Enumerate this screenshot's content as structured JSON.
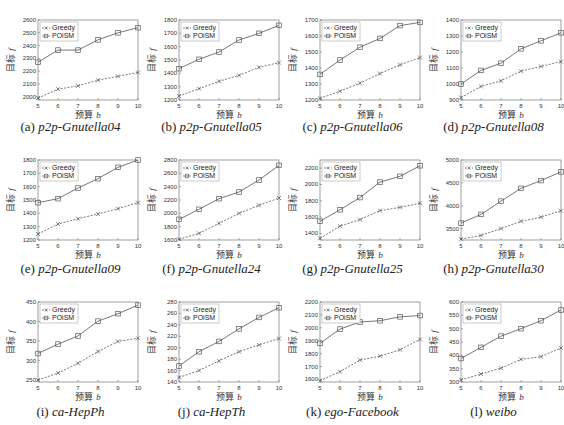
{
  "figure": {
    "x_label_text": "预算",
    "x_label_var": "b",
    "y_label_text": "目标",
    "y_label_var": "f",
    "legend": [
      "Greedy",
      "POiSM"
    ],
    "colors": {
      "line": "#555555",
      "axis": "#777777",
      "text": "#333333"
    }
  },
  "chart_data": [
    {
      "type": "line",
      "panel": "(a)",
      "title": "p2p-Gnutella04",
      "xlabel": "预算 b",
      "ylabel": "目标 f",
      "x": [
        5,
        6,
        7,
        8,
        9,
        10
      ],
      "yticks": [
        2000,
        2100,
        2200,
        2300,
        2400,
        2500,
        2600
      ],
      "ylim": [
        1975,
        2600
      ],
      "series": [
        {
          "name": "Greedy",
          "marker": "x",
          "linestyle": "dashed",
          "values": [
            1990,
            2060,
            2085,
            2130,
            2160,
            2190
          ]
        },
        {
          "name": "POiSM",
          "marker": "square",
          "linestyle": "solid",
          "values": [
            2270,
            2365,
            2365,
            2445,
            2500,
            2540
          ]
        }
      ],
      "legend_position": "upper left",
      "grid": false
    },
    {
      "type": "line",
      "panel": "(b)",
      "title": "p2p-Gnutella05",
      "xlabel": "预算 b",
      "ylabel": "目标 f",
      "x": [
        5,
        6,
        7,
        8,
        9,
        10
      ],
      "yticks": [
        1200,
        1300,
        1400,
        1500,
        1600,
        1700,
        1800
      ],
      "ylim": [
        1200,
        1800
      ],
      "series": [
        {
          "name": "Greedy",
          "marker": "x",
          "linestyle": "dashed",
          "values": [
            1230,
            1285,
            1340,
            1385,
            1445,
            1480
          ]
        },
        {
          "name": "POiSM",
          "marker": "square",
          "linestyle": "solid",
          "values": [
            1435,
            1505,
            1560,
            1650,
            1700,
            1760
          ]
        }
      ],
      "legend_position": "upper left",
      "grid": false
    },
    {
      "type": "line",
      "panel": "(c)",
      "title": "p2p-Gnutella06",
      "xlabel": "预算 b",
      "ylabel": "目标 f",
      "x": [
        5,
        6,
        7,
        8,
        9,
        10
      ],
      "yticks": [
        1200,
        1300,
        1400,
        1500,
        1600,
        1700
      ],
      "ylim": [
        1200,
        1700
      ],
      "series": [
        {
          "name": "Greedy",
          "marker": "x",
          "linestyle": "dashed",
          "values": [
            1210,
            1255,
            1305,
            1365,
            1420,
            1465
          ]
        },
        {
          "name": "POiSM",
          "marker": "square",
          "linestyle": "solid",
          "values": [
            1360,
            1450,
            1530,
            1585,
            1665,
            1685
          ]
        }
      ],
      "legend_position": "upper left",
      "grid": false
    },
    {
      "type": "line",
      "panel": "(d)",
      "title": "p2p-Gnutella08",
      "xlabel": "预算 b",
      "ylabel": "目标 f",
      "x": [
        5,
        6,
        7,
        8,
        9,
        10
      ],
      "yticks": [
        900,
        1000,
        1100,
        1200,
        1300,
        1400
      ],
      "ylim": [
        900,
        1400
      ],
      "series": [
        {
          "name": "Greedy",
          "marker": "x",
          "linestyle": "dashed",
          "values": [
            915,
            985,
            1020,
            1080,
            1110,
            1140
          ]
        },
        {
          "name": "POiSM",
          "marker": "square",
          "linestyle": "solid",
          "values": [
            1000,
            1085,
            1130,
            1220,
            1270,
            1320
          ]
        }
      ],
      "legend_position": "upper left",
      "grid": false
    },
    {
      "type": "line",
      "panel": "(e)",
      "title": "p2p-Gnutella09",
      "xlabel": "预算 b",
      "ylabel": "目标 f",
      "x": [
        5,
        6,
        7,
        8,
        9,
        10
      ],
      "yticks": [
        1200,
        1300,
        1400,
        1500,
        1600,
        1700,
        1800
      ],
      "ylim": [
        1200,
        1800
      ],
      "series": [
        {
          "name": "Greedy",
          "marker": "x",
          "linestyle": "dashed",
          "values": [
            1245,
            1320,
            1360,
            1395,
            1435,
            1480
          ]
        },
        {
          "name": "POiSM",
          "marker": "square",
          "linestyle": "solid",
          "values": [
            1480,
            1510,
            1590,
            1660,
            1745,
            1800
          ]
        }
      ],
      "legend_position": "upper left",
      "grid": false
    },
    {
      "type": "line",
      "panel": "(f)",
      "title": "p2p-Gnutella24",
      "xlabel": "预算 b",
      "ylabel": "目标 f",
      "x": [
        5,
        6,
        7,
        8,
        9,
        10
      ],
      "yticks": [
        1600,
        1800,
        2000,
        2200,
        2400,
        2600,
        2800
      ],
      "ylim": [
        1600,
        2800
      ],
      "series": [
        {
          "name": "Greedy",
          "marker": "x",
          "linestyle": "dashed",
          "values": [
            1610,
            1700,
            1850,
            2000,
            2120,
            2230
          ]
        },
        {
          "name": "POiSM",
          "marker": "square",
          "linestyle": "solid",
          "values": [
            1910,
            2060,
            2220,
            2320,
            2500,
            2720
          ]
        }
      ],
      "legend_position": "upper left",
      "grid": false
    },
    {
      "type": "line",
      "panel": "(g)",
      "title": "p2p-Gnutella25",
      "xlabel": "预算 b",
      "ylabel": "目标 f",
      "x": [
        5,
        6,
        7,
        8,
        9,
        10
      ],
      "yticks": [
        1400,
        1600,
        1800,
        2000,
        2200
      ],
      "ylim": [
        1320,
        2300
      ],
      "series": [
        {
          "name": "Greedy",
          "marker": "x",
          "linestyle": "dashed",
          "values": [
            1340,
            1490,
            1570,
            1680,
            1720,
            1770
          ]
        },
        {
          "name": "POiSM",
          "marker": "square",
          "linestyle": "solid",
          "values": [
            1550,
            1690,
            1840,
            2030,
            2100,
            2230
          ]
        }
      ],
      "legend_position": "upper left",
      "grid": false
    },
    {
      "type": "line",
      "panel": "(h)",
      "title": "p2p-Gnutella30",
      "xlabel": "预算 b",
      "ylabel": "目标 f",
      "x": [
        5,
        6,
        7,
        8,
        9,
        10
      ],
      "yticks": [
        3500,
        4000,
        4500,
        5000
      ],
      "ylim": [
        3250,
        5000
      ],
      "series": [
        {
          "name": "Greedy",
          "marker": "x",
          "linestyle": "dashed",
          "values": [
            3270,
            3350,
            3500,
            3660,
            3750,
            3890
          ]
        },
        {
          "name": "POiSM",
          "marker": "square",
          "linestyle": "solid",
          "values": [
            3620,
            3810,
            4100,
            4380,
            4550,
            4740
          ]
        }
      ],
      "legend_position": "upper left",
      "grid": false
    },
    {
      "type": "line",
      "panel": "(i)",
      "title": "ca-HepPh",
      "xlabel": "预算 b",
      "ylabel": "目标 f",
      "x": [
        5,
        6,
        7,
        8,
        9,
        10
      ],
      "yticks": [
        250,
        300,
        350,
        400,
        450
      ],
      "ylim": [
        245,
        450
      ],
      "series": [
        {
          "name": "Greedy",
          "marker": "x",
          "linestyle": "dashed",
          "values": [
            250,
            268,
            293,
            323,
            349,
            357
          ]
        },
        {
          "name": "POiSM",
          "marker": "square",
          "linestyle": "solid",
          "values": [
            318,
            342,
            363,
            401,
            420,
            442
          ]
        }
      ],
      "legend_position": "upper left",
      "grid": false
    },
    {
      "type": "line",
      "panel": "(j)",
      "title": "ca-HepTh",
      "xlabel": "预算 b",
      "ylabel": "目标 f",
      "x": [
        5,
        6,
        7,
        8,
        9,
        10
      ],
      "yticks": [
        140,
        160,
        180,
        200,
        220,
        240,
        260,
        280
      ],
      "ylim": [
        140,
        280
      ],
      "series": [
        {
          "name": "Greedy",
          "marker": "x",
          "linestyle": "dashed",
          "values": [
            148,
            160,
            177,
            193,
            205,
            216
          ]
        },
        {
          "name": "POiSM",
          "marker": "square",
          "linestyle": "solid",
          "values": [
            168,
            193,
            211,
            233,
            253,
            270
          ]
        }
      ],
      "legend_position": "upper left",
      "grid": false
    },
    {
      "type": "line",
      "panel": "(k)",
      "title": "ego-Facebook",
      "xlabel": "预算 b",
      "ylabel": "目标 f",
      "x": [
        5,
        6,
        7,
        8,
        9,
        10
      ],
      "yticks": [
        1600,
        1700,
        1800,
        1900,
        2000,
        2100,
        2200
      ],
      "ylim": [
        1580,
        2200
      ],
      "series": [
        {
          "name": "Greedy",
          "marker": "x",
          "linestyle": "dashed",
          "values": [
            1590,
            1660,
            1750,
            1780,
            1830,
            1910
          ]
        },
        {
          "name": "POiSM",
          "marker": "square",
          "linestyle": "solid",
          "values": [
            1880,
            1990,
            2045,
            2055,
            2085,
            2095
          ]
        }
      ],
      "legend_position": "upper left",
      "grid": false
    },
    {
      "type": "line",
      "panel": "(l)",
      "title": "weibo",
      "xlabel": "预算 b",
      "ylabel": "目标 f",
      "x": [
        5,
        6,
        7,
        8,
        9,
        10
      ],
      "yticks": [
        300,
        350,
        400,
        450,
        500,
        550,
        600
      ],
      "ylim": [
        300,
        600
      ],
      "series": [
        {
          "name": "Greedy",
          "marker": "x",
          "linestyle": "dashed",
          "values": [
            308,
            330,
            352,
            385,
            395,
            428
          ]
        },
        {
          "name": "POiSM",
          "marker": "square",
          "linestyle": "solid",
          "values": [
            388,
            430,
            472,
            500,
            530,
            570
          ]
        }
      ],
      "legend_position": "upper left",
      "grid": false
    }
  ]
}
